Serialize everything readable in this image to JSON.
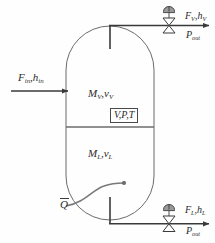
{
  "diagram": {
    "vessel": {
      "vapor_label": "M",
      "vapor_sub1": "V",
      "vapor_label2": "v",
      "vapor_sub2": "V",
      "liquid_label": "M",
      "liquid_sub1": "L",
      "liquid_label2": "v",
      "liquid_sub2": "L",
      "state_box": "V,P,T"
    },
    "streams": {
      "inlet": {
        "flow": "F",
        "flow_sub": "in",
        "enthalpy": "h",
        "enthalpy_sub": "in"
      },
      "vapor_outlet": {
        "flow": "F",
        "flow_sub": "V",
        "enthalpy": "h",
        "enthalpy_sub": "V",
        "pressure": "P",
        "pressure_sub": "out"
      },
      "liquid_outlet": {
        "flow": "F",
        "flow_sub": "L",
        "enthalpy": "h",
        "enthalpy_sub": "L",
        "pressure": "P",
        "pressure_sub": "out"
      },
      "heat_input": {
        "symbol": "Q"
      }
    },
    "colors": {
      "line": "#4a4a4a",
      "line_dark": "#3a3a3a",
      "text": "#2b2b2b",
      "background": "#fefefe"
    }
  }
}
